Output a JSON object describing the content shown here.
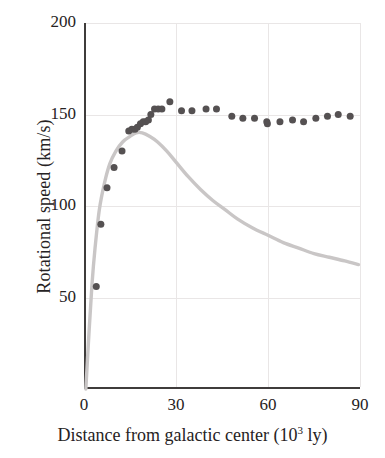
{
  "chart_data": {
    "type": "scatter",
    "title": "",
    "xlabel": "Distance from galactic center (10³ ly)",
    "xlabel_main": "Distance from galactic center (10",
    "xlabel_sup": "3",
    "xlabel_tail": " ly)",
    "ylabel": "Rotational speed (km/s)",
    "xlim": [
      0,
      90
    ],
    "ylim": [
      0,
      200
    ],
    "xticks": [
      0,
      30,
      60,
      90
    ],
    "xtick_labels": [
      "0",
      "30",
      "60",
      "90"
    ],
    "yticks": [
      50,
      100,
      150,
      200
    ],
    "ytick_labels": [
      "50",
      "100",
      "150",
      "200"
    ],
    "grid": "faint light-gray gridlines at y=50,100,150,200 and x=30,60,90",
    "legend": "none",
    "series": [
      {
        "name": "Observed rotational speed (data points)",
        "marker": "filled circle",
        "color": "#555152",
        "marker_size_px": 7,
        "points": [
          {
            "x": 4.0,
            "y": 56
          },
          {
            "x": 5.5,
            "y": 90
          },
          {
            "x": 7.5,
            "y": 110
          },
          {
            "x": 9.8,
            "y": 121
          },
          {
            "x": 12.4,
            "y": 130
          },
          {
            "x": 14.6,
            "y": 141
          },
          {
            "x": 15.6,
            "y": 142
          },
          {
            "x": 16.6,
            "y": 142
          },
          {
            "x": 17.4,
            "y": 143
          },
          {
            "x": 18.4,
            "y": 145
          },
          {
            "x": 19.3,
            "y": 146
          },
          {
            "x": 20.1,
            "y": 146
          },
          {
            "x": 21.0,
            "y": 147
          },
          {
            "x": 21.8,
            "y": 150
          },
          {
            "x": 23.0,
            "y": 153
          },
          {
            "x": 24.2,
            "y": 153
          },
          {
            "x": 25.4,
            "y": 153
          },
          {
            "x": 28.0,
            "y": 157
          },
          {
            "x": 31.8,
            "y": 152
          },
          {
            "x": 35.2,
            "y": 152
          },
          {
            "x": 39.8,
            "y": 153
          },
          {
            "x": 43.2,
            "y": 153
          },
          {
            "x": 48.2,
            "y": 149
          },
          {
            "x": 51.8,
            "y": 148
          },
          {
            "x": 55.6,
            "y": 148
          },
          {
            "x": 59.6,
            "y": 146
          },
          {
            "x": 59.8,
            "y": 145
          },
          {
            "x": 63.9,
            "y": 146
          },
          {
            "x": 68.0,
            "y": 147
          },
          {
            "x": 71.6,
            "y": 146
          },
          {
            "x": 75.6,
            "y": 148
          },
          {
            "x": 79.4,
            "y": 149
          },
          {
            "x": 82.9,
            "y": 150
          },
          {
            "x": 86.8,
            "y": 149
          }
        ]
      },
      {
        "name": "Predicted Keplerian rotation curve (line)",
        "marker": "none",
        "color": "#c9c6c6",
        "line_width_px": 3.4,
        "points": [
          {
            "x": 0.6,
            "y": 0
          },
          {
            "x": 1.6,
            "y": 30
          },
          {
            "x": 2.6,
            "y": 57
          },
          {
            "x": 3.6,
            "y": 77
          },
          {
            "x": 5.0,
            "y": 98
          },
          {
            "x": 6.6,
            "y": 112
          },
          {
            "x": 8.4,
            "y": 123
          },
          {
            "x": 10.4,
            "y": 130
          },
          {
            "x": 12.6,
            "y": 135
          },
          {
            "x": 15.0,
            "y": 138
          },
          {
            "x": 17.0,
            "y": 140
          },
          {
            "x": 19.0,
            "y": 140
          },
          {
            "x": 21.5,
            "y": 138
          },
          {
            "x": 24.0,
            "y": 135
          },
          {
            "x": 27.0,
            "y": 130
          },
          {
            "x": 30.0,
            "y": 124
          },
          {
            "x": 34.0,
            "y": 116
          },
          {
            "x": 38.0,
            "y": 109
          },
          {
            "x": 42.0,
            "y": 103
          },
          {
            "x": 46.0,
            "y": 98
          },
          {
            "x": 50.0,
            "y": 93
          },
          {
            "x": 55.0,
            "y": 88
          },
          {
            "x": 60.0,
            "y": 84
          },
          {
            "x": 65.0,
            "y": 80
          },
          {
            "x": 70.0,
            "y": 77
          },
          {
            "x": 75.0,
            "y": 74
          },
          {
            "x": 80.0,
            "y": 72
          },
          {
            "x": 85.0,
            "y": 70
          },
          {
            "x": 89.5,
            "y": 68
          }
        ]
      }
    ]
  }
}
